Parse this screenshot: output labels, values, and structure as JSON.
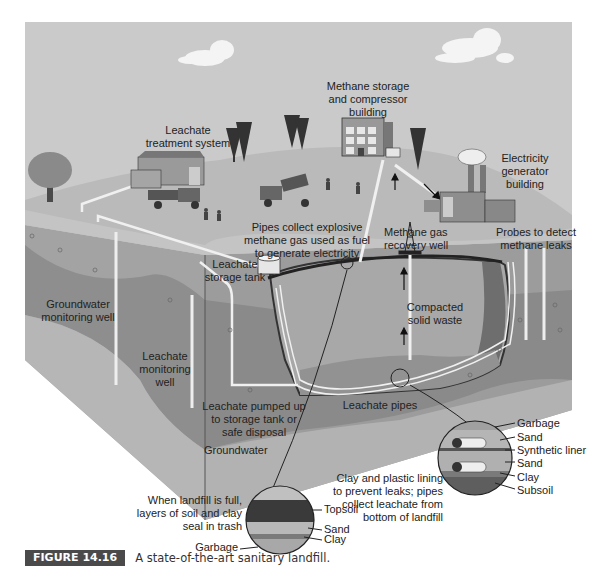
{
  "figure": {
    "number_label": "FIGURE 14.16",
    "caption": "A state-of-the-art sanitary landfill."
  },
  "surface_labels": {
    "leachate_treatment": [
      "Leachate",
      "treatment system"
    ],
    "methane_storage": [
      "Methane storage",
      "and compressor",
      "building"
    ],
    "electricity_generator": [
      "Electricity",
      "generator",
      "building"
    ],
    "pipes_collect": [
      "Pipes collect explosive",
      "methane gas used as fuel",
      "to generate electricity"
    ],
    "methane_recovery_well": [
      "Methane gas",
      "recovery well"
    ],
    "probes": [
      "Probes to detect",
      "methane leaks"
    ],
    "leachate_storage_tank": [
      "Leachate",
      "storage tank"
    ]
  },
  "underground_labels": {
    "groundwater_monitoring_well": [
      "Groundwater",
      "monitoring well"
    ],
    "leachate_monitoring_well": [
      "Leachate",
      "monitoring",
      "well"
    ],
    "compacted_solid_waste": [
      "Compacted",
      "solid waste"
    ],
    "leachate_pumped": [
      "Leachate pumped up",
      "to storage tank or",
      "safe disposal"
    ],
    "leachate_pipes": "Leachate pipes",
    "groundwater": "Groundwater"
  },
  "cap_detail": {
    "description": [
      "When landfill is full,",
      "layers of soil and clay",
      "seal in trash"
    ],
    "layers": [
      "Topsoil",
      "Sand",
      "Clay",
      "Garbage"
    ]
  },
  "liner_detail": {
    "description": [
      "Clay and plastic lining",
      "to prevent leaks; pipes",
      "collect leachate from",
      "bottom of landfill"
    ],
    "layers": [
      "Garbage",
      "Sand",
      "Synthetic liner",
      "Sand",
      "Clay",
      "Subsoil"
    ]
  },
  "colors": {
    "sky": "#c8c8c8",
    "surface": "#bdbdbd",
    "soil_dark": "#8a8a8a",
    "soil_mid": "#a6a6a6",
    "groundwater": "#b3b3b3",
    "waste": "#a9a9a9",
    "caption_badge": "#4a4a4a"
  }
}
